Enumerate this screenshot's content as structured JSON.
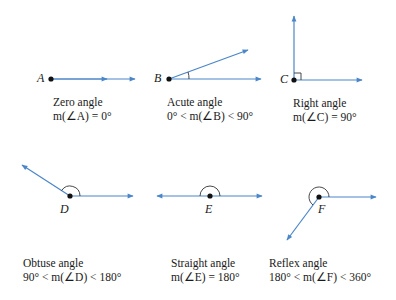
{
  "colors": {
    "ray": "#4a86c8",
    "ink": "#1a1a1a"
  },
  "angles": [
    {
      "id": "zero",
      "vertex": "A",
      "name": "Zero angle",
      "measure": "m(∠A) = 0°"
    },
    {
      "id": "acute",
      "vertex": "B",
      "name": "Acute angle",
      "measure": "0° < m(∠B) < 90°"
    },
    {
      "id": "right",
      "vertex": "C",
      "name": "Right angle",
      "measure": "m(∠C) = 90°"
    },
    {
      "id": "obtuse",
      "vertex": "D",
      "name": "Obtuse angle",
      "measure": "90° < m(∠D) < 180°"
    },
    {
      "id": "straight",
      "vertex": "E",
      "name": "Straight angle",
      "measure": "m(∠E) = 180°"
    },
    {
      "id": "reflex",
      "vertex": "F",
      "name": "Reflex angle",
      "measure": "180° < m(∠F) < 360°"
    }
  ]
}
